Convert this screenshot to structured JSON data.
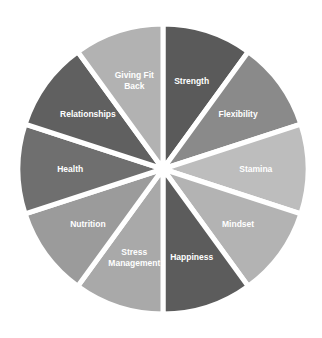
{
  "wheel": {
    "center": [
      163,
      169
    ],
    "radius": 145,
    "gap": 5,
    "segments": [
      {
        "label": [
          "Strength"
        ],
        "color": "#5a5a5a"
      },
      {
        "label": [
          "Flexibility"
        ],
        "color": "#8a8a8a"
      },
      {
        "label": [
          "Stamina"
        ],
        "color": "#bdbdbd"
      },
      {
        "label": [
          "Mindset"
        ],
        "color": "#b3b3b3"
      },
      {
        "label": [
          "Happiness"
        ],
        "color": "#5c5c5c"
      },
      {
        "label": [
          "Stress",
          "Management"
        ],
        "color": "#a9a9a9"
      },
      {
        "label": [
          "Nutrition"
        ],
        "color": "#9b9b9b"
      },
      {
        "label": [
          "Health"
        ],
        "color": "#6f6f6f"
      },
      {
        "label": [
          "Relationships"
        ],
        "color": "#606060"
      },
      {
        "label": [
          "Giving Fit",
          "Back"
        ],
        "color": "#b2b2b2"
      }
    ]
  }
}
